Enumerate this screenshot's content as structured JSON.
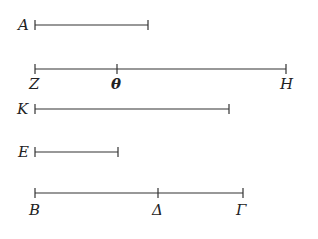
{
  "diagram": {
    "segments": [
      {
        "id": "A",
        "label": "A",
        "y": 25,
        "x1": 35,
        "x2": 148,
        "label_pos": "left",
        "ticks": []
      },
      {
        "id": "ZH",
        "y": 69,
        "x1": 35,
        "x2": 286,
        "label_pos": "below",
        "points": [
          {
            "label": "Z",
            "x": 35
          },
          {
            "label": "θ",
            "x": 117
          },
          {
            "label": "H",
            "x": 286
          }
        ]
      },
      {
        "id": "K",
        "label": "K",
        "y": 109,
        "x1": 35,
        "x2": 229,
        "label_pos": "left",
        "ticks": []
      },
      {
        "id": "E",
        "label": "E",
        "y": 152,
        "x1": 35,
        "x2": 118,
        "label_pos": "left",
        "ticks": []
      },
      {
        "id": "BΓ",
        "y": 193,
        "x1": 35,
        "x2": 243,
        "label_pos": "below",
        "points": [
          {
            "label": "B",
            "x": 35
          },
          {
            "label": "Δ",
            "x": 158
          },
          {
            "label": "Γ",
            "x": 243
          }
        ]
      }
    ]
  },
  "labels": {
    "A": "A",
    "Z": "Z",
    "theta": "θ",
    "H": "H",
    "K": "K",
    "E": "E",
    "B": "B",
    "Delta": "Δ",
    "Gamma": "Γ"
  }
}
